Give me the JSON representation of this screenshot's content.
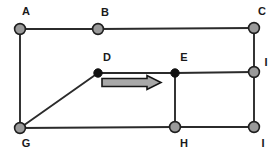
{
  "figure": {
    "background_color": "#ffffff"
  },
  "chart_data": {
    "type": "diagram",
    "title": "",
    "xlabel": "",
    "ylabel": "",
    "xlim": [
      0,
      278
    ],
    "ylim": [
      0,
      153
    ],
    "grid": false,
    "legend": null,
    "colors": {
      "edge": "#2b2b2b",
      "node_open_fill": "#9a9a9a",
      "node_open_stroke": "#1f1f1f",
      "node_filled": "#111111",
      "arrow_fill": "#a8a8a8",
      "arrow_stroke": "#161616",
      "label": "#1a1a1a",
      "background": "#ffffff"
    },
    "nodes": [
      {
        "id": "A",
        "label": "A",
        "x": 20,
        "y": 29,
        "style": "open",
        "radius": 5.4,
        "label_x": 26,
        "label_y": 12
      },
      {
        "id": "B",
        "label": "B",
        "x": 98,
        "y": 29,
        "style": "open",
        "radius": 5.4,
        "label_x": 105,
        "label_y": 13
      },
      {
        "id": "C",
        "label": "C",
        "x": 254,
        "y": 28,
        "style": "open",
        "radius": 5.4,
        "label_x": 262,
        "label_y": 12
      },
      {
        "id": "D",
        "label": "D",
        "x": 98,
        "y": 73,
        "style": "filled",
        "radius": 4.2,
        "label_x": 107,
        "label_y": 58
      },
      {
        "id": "E",
        "label": "E",
        "x": 175,
        "y": 73,
        "style": "filled",
        "radius": 4.2,
        "label_x": 184,
        "label_y": 58
      },
      {
        "id": "F",
        "label": "I",
        "x": 254,
        "y": 72,
        "style": "open",
        "radius": 5.4,
        "label_x": 266,
        "label_y": 63
      },
      {
        "id": "G",
        "label": "G",
        "x": 20,
        "y": 128,
        "style": "open",
        "radius": 5.4,
        "label_x": 26,
        "label_y": 144
      },
      {
        "id": "H",
        "label": "H",
        "x": 175,
        "y": 127,
        "style": "open",
        "radius": 5.4,
        "label_x": 184,
        "label_y": 144
      },
      {
        "id": "I",
        "label": "I",
        "x": 254,
        "y": 127,
        "style": "open",
        "radius": 5.4,
        "label_x": 263,
        "label_y": 144
      }
    ],
    "edges": [
      {
        "from": "A",
        "to": "B",
        "x1": 20,
        "y1": 29,
        "x2": 98,
        "y2": 29
      },
      {
        "from": "B",
        "to": "C",
        "x1": 98,
        "y1": 29,
        "x2": 254,
        "y2": 28
      },
      {
        "from": "A",
        "to": "G",
        "x1": 20,
        "y1": 29,
        "x2": 20,
        "y2": 128
      },
      {
        "from": "C",
        "to": "F",
        "x1": 254,
        "y1": 28,
        "x2": 254,
        "y2": 72
      },
      {
        "from": "G",
        "to": "D",
        "x1": 20,
        "y1": 128,
        "x2": 98,
        "y2": 73
      },
      {
        "from": "D",
        "to": "E",
        "x1": 98,
        "y1": 73,
        "x2": 175,
        "y2": 73
      },
      {
        "from": "E",
        "to": "F",
        "x1": 175,
        "y1": 73,
        "x2": 254,
        "y2": 72
      },
      {
        "from": "E",
        "to": "H",
        "x1": 175,
        "y1": 73,
        "x2": 175,
        "y2": 127
      },
      {
        "from": "F",
        "to": "I",
        "x1": 254,
        "y1": 72,
        "x2": 254,
        "y2": 127
      },
      {
        "from": "G",
        "to": "H",
        "x1": 20,
        "y1": 128,
        "x2": 175,
        "y2": 127
      },
      {
        "from": "H",
        "to": "I",
        "x1": 175,
        "y1": 127,
        "x2": 254,
        "y2": 127
      }
    ],
    "annotations": [
      {
        "kind": "block-arrow",
        "direction": "right",
        "from_node": "D",
        "to_node": "E",
        "tail_x": 102,
        "tip_x": 161,
        "center_y": 82.5,
        "shaft_half_height": 4.0,
        "head_half_height": 7.0,
        "head_length": 14,
        "points": "102,78.5 147,78.5 147,75.5 161,82.5 147,89.5 147,86.5 102,86.5"
      }
    ]
  }
}
